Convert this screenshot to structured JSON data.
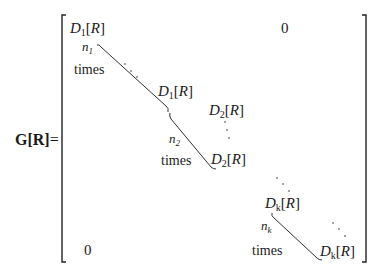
{
  "equation": {
    "lhs": {
      "symbol": "G",
      "argument": "R",
      "equals": "="
    },
    "matrix": {
      "upper_right_zero": "0",
      "lower_left_zero": "0",
      "blocks": [
        {
          "name": "D",
          "sub": "1",
          "arg": "R",
          "count": "n",
          "count_sub": "1",
          "word": "times"
        },
        {
          "name": "D",
          "sub": "2",
          "arg": "R",
          "count": "n",
          "count_sub": "2",
          "word": "times"
        },
        {
          "name": "D",
          "sub": "k",
          "arg": "R",
          "count": "n",
          "count_sub": "k",
          "word": "times"
        }
      ]
    }
  }
}
